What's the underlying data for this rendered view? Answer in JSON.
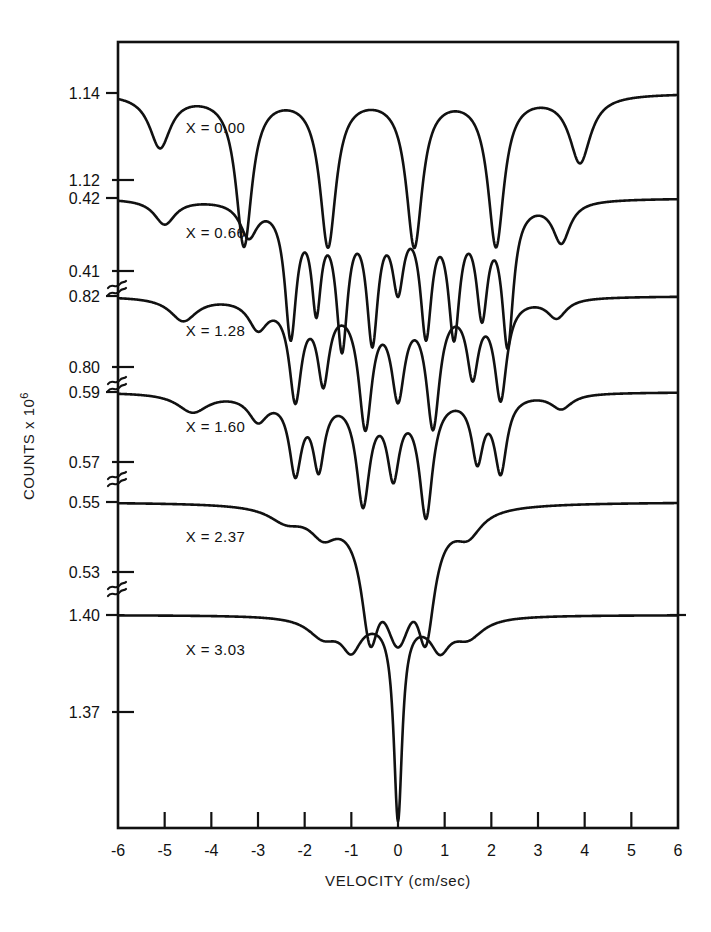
{
  "figure": {
    "xlabel": "VELOCITY (cm/sec)",
    "ylabel_main": "COUNTS x 10",
    "ylabel_exp": "6"
  },
  "chart_data": {
    "type": "line",
    "title": "",
    "xlabel": "VELOCITY (cm/sec)",
    "ylabel": "COUNTS x 10^6",
    "xlim": [
      -6,
      6
    ],
    "grid": false,
    "legend": "none",
    "xticks": [
      "-6",
      "-5",
      "-4",
      "-3",
      "-2",
      "-1",
      "0",
      "1",
      "2",
      "3",
      "4",
      "5",
      "6"
    ],
    "xtick_values": [
      -6,
      -5,
      -4,
      -3,
      -2,
      -1,
      0,
      1,
      2,
      3,
      4,
      5,
      6
    ],
    "axis_breaks": 5,
    "panels": [
      {
        "label": "X = 0.00",
        "baseline_value": "1.14",
        "lower_tick_value": "1.12",
        "ylim": [
          1.12,
          1.14
        ],
        "line_positions": [
          -5.1,
          -3.3,
          -1.5,
          0.35,
          2.1,
          3.9
        ],
        "depths": [
          0.35,
          1.0,
          1.0,
          1.0,
          1.0,
          0.45
        ],
        "widths": [
          0.55,
          0.42,
          0.42,
          0.42,
          0.42,
          0.55
        ],
        "description": "magnetically split six-line sextet, fully resolved"
      },
      {
        "label": "X = 0.66",
        "baseline_value": "0.42",
        "lower_tick_value": "0.41",
        "ylim": [
          0.41,
          0.42
        ],
        "line_positions": [
          -5.0,
          -3.2,
          -2.3,
          -1.75,
          -1.2,
          -0.55,
          0.0,
          0.6,
          1.2,
          1.8,
          2.35,
          3.5
        ],
        "depths": [
          0.18,
          0.25,
          0.95,
          0.7,
          1.0,
          0.95,
          0.55,
          0.9,
          0.9,
          0.75,
          1.0,
          0.3
        ],
        "widths": [
          0.55,
          0.45,
          0.3,
          0.25,
          0.3,
          0.3,
          0.3,
          0.3,
          0.3,
          0.3,
          0.3,
          0.45
        ],
        "description": "broadened, partially collapsed hyperfine structure"
      },
      {
        "label": "X = 1.28",
        "baseline_value": "0.82",
        "lower_tick_value": "0.80",
        "ylim": [
          0.8,
          0.82
        ],
        "line_positions": [
          -4.6,
          -3.0,
          -2.2,
          -1.6,
          -0.7,
          0.0,
          0.75,
          1.6,
          2.2,
          3.4
        ],
        "depths": [
          0.18,
          0.22,
          0.75,
          0.6,
          0.95,
          0.7,
          0.95,
          0.55,
          0.75,
          0.15
        ],
        "widths": [
          0.7,
          0.5,
          0.32,
          0.3,
          0.35,
          0.35,
          0.35,
          0.3,
          0.32,
          0.5
        ],
        "description": "further collapsed, central doublet emerging"
      },
      {
        "label": "X = 1.60",
        "baseline_value": "0.59",
        "lower_tick_value": "0.57",
        "ylim": [
          0.57,
          0.59
        ],
        "line_positions": [
          -4.4,
          -3.0,
          -2.2,
          -1.7,
          -0.75,
          -0.1,
          0.6,
          1.7,
          2.2,
          3.5
        ],
        "depths": [
          0.15,
          0.2,
          0.6,
          0.55,
          0.85,
          0.6,
          0.95,
          0.5,
          0.6,
          0.12
        ],
        "widths": [
          0.8,
          0.5,
          0.32,
          0.3,
          0.35,
          0.32,
          0.35,
          0.3,
          0.32,
          0.55
        ],
        "description": "dominant central doublet with weak magnetic wings"
      },
      {
        "label": "X = 2.37",
        "baseline_value": "0.55",
        "lower_tick_value": "0.53",
        "ylim": [
          0.53,
          0.55
        ],
        "line_positions": [
          -2.4,
          -1.6,
          -0.6,
          0.0,
          0.6,
          1.5
        ],
        "depths": [
          0.12,
          0.2,
          0.85,
          1.0,
          0.85,
          0.2
        ],
        "widths": [
          0.9,
          0.7,
          0.45,
          0.8,
          0.45,
          0.7
        ],
        "description": "broad paramagnetic single line centered at zero velocity"
      },
      {
        "label": "X = 3.03",
        "baseline_value": "1.40",
        "lower_tick_value": "1.37",
        "ylim": [
          1.37,
          1.4
        ],
        "line_positions": [
          -1.6,
          -1.0,
          0.0,
          0.9,
          1.5
        ],
        "depths": [
          0.1,
          0.15,
          1.0,
          0.15,
          0.1
        ],
        "widths": [
          0.8,
          0.5,
          0.22,
          0.5,
          0.8
        ],
        "description": "narrow intense single absorption line at zero velocity"
      }
    ]
  }
}
